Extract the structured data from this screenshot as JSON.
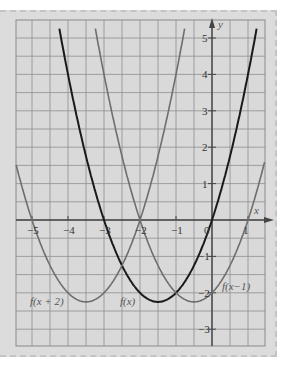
{
  "chart_data": {
    "type": "line",
    "title": "",
    "xlabel": "x",
    "ylabel": "y",
    "xlim": [
      -5.44,
      1.47
    ],
    "ylim": [
      -3.46,
      5.27
    ],
    "grid": true,
    "grid_step": 0.5,
    "x_ticks": [
      -5,
      -4,
      -3,
      -2,
      -1,
      0,
      1
    ],
    "x_tick_labels": [
      "−5",
      "−4",
      "−3",
      "−2",
      "−1",
      "0",
      "1"
    ],
    "y_ticks": [
      5,
      4,
      3,
      2,
      1,
      -1,
      -2,
      -3
    ],
    "y_tick_labels": [
      "5",
      "4",
      "3",
      "2",
      "1",
      "−1",
      "−2",
      "−3"
    ],
    "series": [
      {
        "name": "f(x)",
        "label": "f(x)",
        "expression": "x^2 + 3x",
        "color": "#1a1a1a",
        "roots": [
          -3,
          0
        ],
        "vertex": [
          -1.5,
          -2.25
        ]
      },
      {
        "name": "f(x+2)",
        "label": "f(x + 2)",
        "expression": "(x+2)^2 + 3(x+2)",
        "color": "#6e6e6e",
        "roots": [
          -5,
          -2
        ],
        "vertex": [
          -3.5,
          -2.25
        ]
      },
      {
        "name": "f(x-1)",
        "label": "f(x−1)",
        "expression": "(x-1)^2 + 3(x-1)",
        "color": "#6e6e6e",
        "roots": [
          -2,
          1
        ],
        "vertex": [
          -0.5,
          -2.25
        ]
      }
    ]
  },
  "labels": {
    "x_axis": "x",
    "y_axis": "y",
    "f": "f(x)",
    "f_plus_2": "f(x + 2)",
    "f_minus_1": "f(x−1)"
  },
  "ticks": {
    "x": [
      "−5",
      "−4",
      "−3",
      "−2",
      "−1",
      "0",
      "1"
    ],
    "y": [
      "5",
      "4",
      "3",
      "2",
      "1",
      "−1",
      "−2",
      "−3"
    ]
  }
}
